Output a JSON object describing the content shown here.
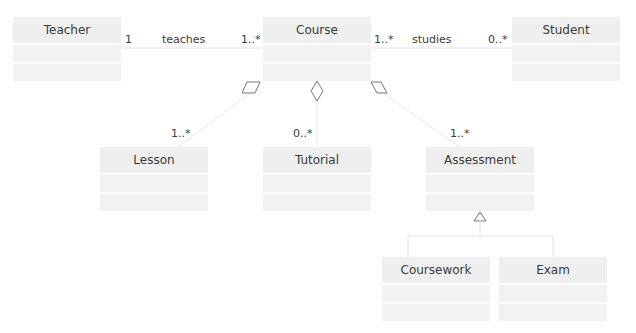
{
  "classes": {
    "teacher": "Teacher",
    "course": "Course",
    "student": "Student",
    "lesson": "Lesson",
    "tutorial": "Tutorial",
    "assessment": "Assessment",
    "coursework": "Coursework",
    "exam": "Exam"
  },
  "associations": {
    "teaches": {
      "label": "teaches",
      "left_mult": "1",
      "right_mult": "1..*"
    },
    "studies": {
      "label": "studies",
      "left_mult": "1..*",
      "right_mult": "0..*"
    }
  },
  "aggregations": {
    "lesson_mult": "1..*",
    "tutorial_mult": "0..*",
    "assessment_mult": "1..*"
  },
  "colors": {
    "box": "#efefef",
    "line": "#dddddd",
    "symbol": "#777777"
  }
}
